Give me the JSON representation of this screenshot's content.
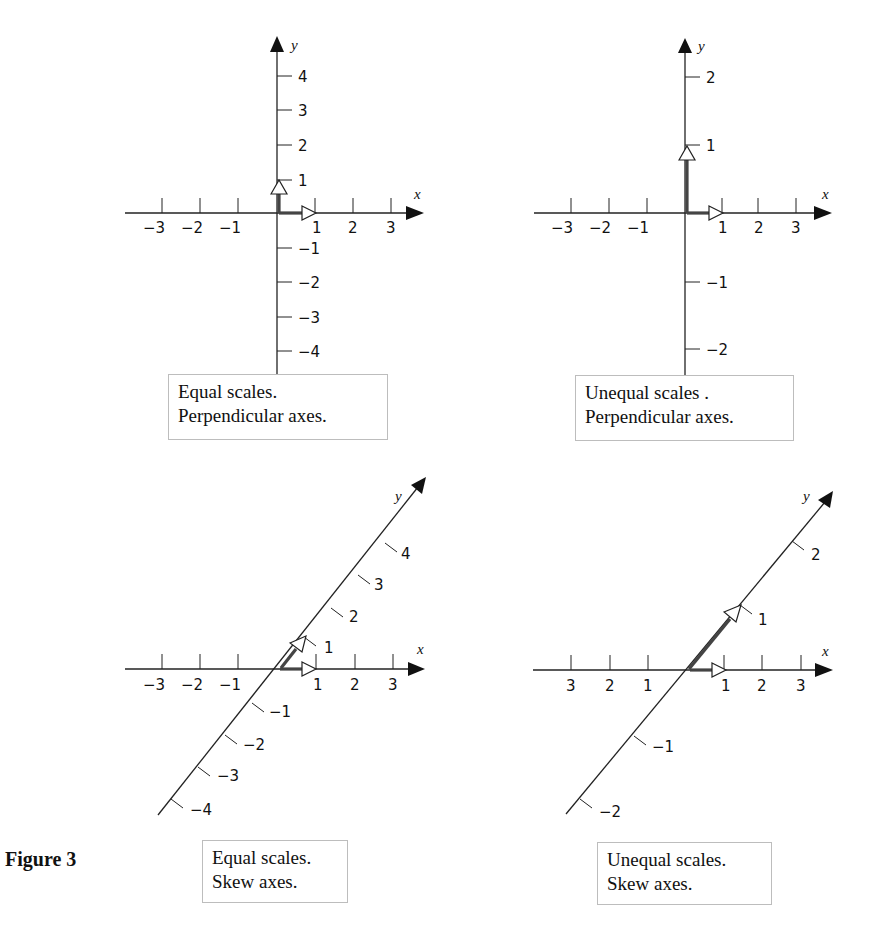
{
  "figure": {
    "label": "Figure 3"
  },
  "colors": {
    "axis": "#222222",
    "unit_vector": "#444444",
    "caption_border": "#bdbdbd"
  },
  "panels": [
    {
      "id": "equal-perpendicular",
      "caption": [
        "Equal scales.",
        "Perpendicular axes."
      ],
      "x_axis": {
        "label": "x",
        "ticks": [
          "−3",
          "−2",
          "−1",
          "1",
          "2",
          "3"
        ]
      },
      "y_axis": {
        "label": "y",
        "ticks": [
          "4",
          "3",
          "2",
          "1",
          "−1",
          "−2",
          "−3",
          "−4"
        ]
      }
    },
    {
      "id": "unequal-perpendicular",
      "caption": [
        "Unequal scales .",
        "Perpendicular axes."
      ],
      "x_axis": {
        "label": "x",
        "ticks": [
          "−3",
          "−2",
          "−1",
          "1",
          "2",
          "3"
        ]
      },
      "y_axis": {
        "label": "y",
        "ticks": [
          "2",
          "1",
          "−1",
          "−2"
        ]
      }
    },
    {
      "id": "equal-skew",
      "caption": [
        "Equal scales.",
        "Skew axes."
      ],
      "x_axis": {
        "label": "x",
        "ticks": [
          "−3",
          "−2",
          "−1",
          "1",
          "2",
          "3"
        ]
      },
      "y_axis": {
        "label": "y",
        "ticks": [
          "4",
          "3",
          "2",
          "1",
          "−1",
          "−2",
          "−3",
          "−4"
        ]
      }
    },
    {
      "id": "unequal-skew",
      "caption": [
        "Unequal scales.",
        "Skew axes."
      ],
      "x_axis": {
        "label": "x",
        "ticks": [
          "3",
          "2",
          "1",
          "1",
          "2",
          "3"
        ]
      },
      "y_axis": {
        "label": "y",
        "ticks": [
          "2",
          "1",
          "−1",
          "−2"
        ]
      }
    }
  ]
}
